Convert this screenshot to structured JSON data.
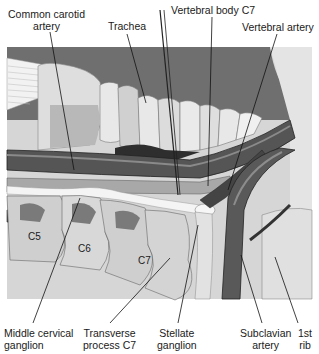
{
  "figure": {
    "colors": {
      "background_dark": "#6e6e6e",
      "bone_light": "#d9d9d9",
      "bone_mid": "#bdbdbd",
      "artery_dark": "#4a4a4a",
      "ganglion": "#f2f2f2",
      "leader_line": "#111111"
    }
  },
  "labels": {
    "common_carotid": [
      "Common carotid",
      "artery"
    ],
    "trachea": [
      "Trachea"
    ],
    "vertebral_body": [
      "Vertebral body C7"
    ],
    "vertebral_artery": [
      "Vertebral artery"
    ],
    "middle_cervical": [
      "Middle cervical",
      "ganglion"
    ],
    "transverse_process": [
      "Transverse",
      "process C7"
    ],
    "stellate": [
      "Stellate",
      "ganglion"
    ],
    "subclavian": [
      "Subclavian",
      "artery"
    ],
    "first_rib": [
      "1st",
      "rib"
    ]
  },
  "vertebra_labels": [
    "C5",
    "C6",
    "C7"
  ]
}
